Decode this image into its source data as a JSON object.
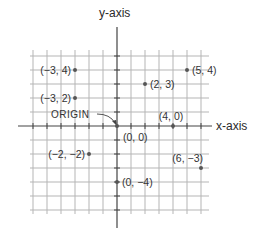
{
  "diagram": {
    "x_axis_label": "x-axis",
    "y_axis_label": "y-axis",
    "origin_label": "ORIGIN",
    "origin": {
      "px": 117,
      "py": 126
    },
    "unit_px": 14,
    "grid": {
      "x_min": -6,
      "x_max": 6,
      "y_min": -6,
      "y_max": 5,
      "color": "#b5b5b5"
    },
    "axis_color": "#444444",
    "point_color": "#555555",
    "points": [
      {
        "x": -3,
        "y": 4,
        "label": "(−3, 4)",
        "label_side": "left"
      },
      {
        "x": 5,
        "y": 4,
        "label": "(5, 4)",
        "label_side": "right"
      },
      {
        "x": 2,
        "y": 3,
        "label": "(2, 3)",
        "label_side": "right"
      },
      {
        "x": -3,
        "y": 2,
        "label": "(−3, 2)",
        "label_side": "left"
      },
      {
        "x": 4,
        "y": 0,
        "label": "(4, 0)",
        "label_side": "above"
      },
      {
        "x": 0,
        "y": 0,
        "label": "(0, 0)",
        "label_side": "below-right"
      },
      {
        "x": -2,
        "y": -2,
        "label": "(−2, −2)",
        "label_side": "left"
      },
      {
        "x": 6,
        "y": -3,
        "label": "(6, −3)",
        "label_side": "above-left"
      },
      {
        "x": 0,
        "y": -4,
        "label": "(0, −4)",
        "label_side": "right"
      }
    ]
  }
}
